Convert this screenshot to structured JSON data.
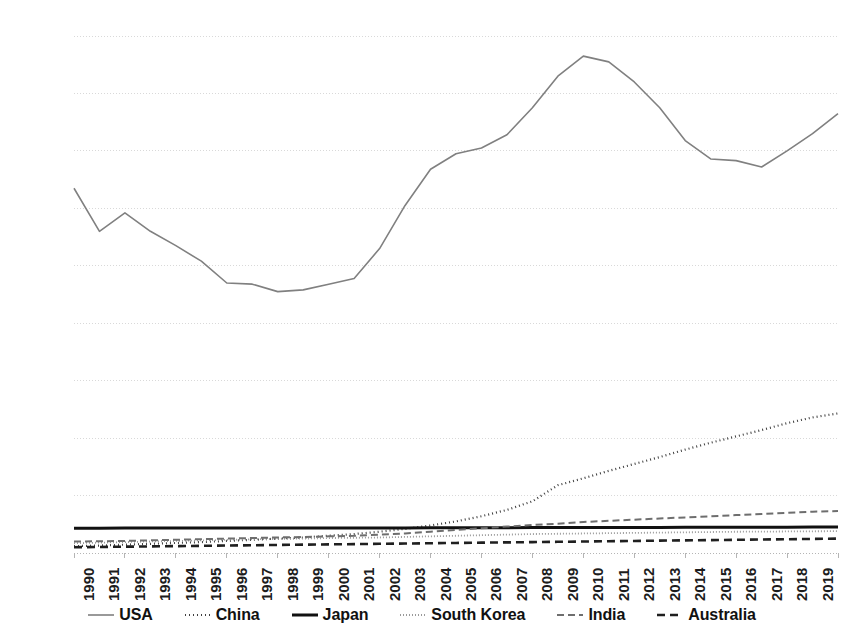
{
  "chart_data": {
    "type": "line",
    "title": "",
    "xlabel": "",
    "ylabel": "",
    "x": [
      1990,
      1991,
      1992,
      1993,
      1994,
      1995,
      1996,
      1997,
      1998,
      1999,
      2000,
      2001,
      2002,
      2003,
      2004,
      2005,
      2006,
      2007,
      2008,
      2009,
      2010,
      2011,
      2012,
      2013,
      2014,
      2015,
      2016,
      2017,
      2018,
      2019,
      2020
    ],
    "xlim": [
      1990,
      2020
    ],
    "ylim": [
      0,
      900000
    ],
    "ytick_labels": [
      "0",
      "100,000",
      "200,000",
      "300,000",
      "400,000",
      "500,000",
      "600,000",
      "700,000",
      "800,000",
      "900,000"
    ],
    "ytick_values": [
      0,
      100000,
      200000,
      300000,
      400000,
      500000,
      600000,
      700000,
      800000,
      900000
    ],
    "xtick_labels": [
      "1990",
      "1991",
      "1992",
      "1993",
      "1994",
      "1995",
      "1996",
      "1997",
      "1998",
      "1999",
      "2000",
      "2001",
      "2002",
      "2003",
      "2004",
      "2005",
      "2006",
      "2007",
      "2008",
      "2009",
      "2010",
      "2011",
      "2012",
      "2013",
      "2014",
      "2015",
      "2016",
      "2017",
      "2018",
      "2019",
      "2020"
    ],
    "grid": true,
    "legend_position": "bottom",
    "series": [
      {
        "name": "USA",
        "color": "#808080",
        "style": "solid",
        "width": 1.6,
        "dash": "",
        "values": [
          635000,
          560000,
          592000,
          560000,
          535000,
          508000,
          470000,
          468000,
          455000,
          458000,
          468000,
          478000,
          530000,
          605000,
          668000,
          695000,
          705000,
          728000,
          775000,
          830000,
          865000,
          855000,
          820000,
          775000,
          718000,
          686000,
          683000,
          672000,
          700000,
          730000,
          765000
        ]
      },
      {
        "name": "China",
        "color": "#3f3f3f",
        "style": "dotted",
        "width": 2.2,
        "dash": "1,3",
        "values": [
          12000,
          13000,
          14500,
          16000,
          17500,
          19000,
          21000,
          23000,
          25000,
          27000,
          30000,
          33000,
          37000,
          42000,
          48000,
          55000,
          64000,
          75000,
          90000,
          118000,
          130000,
          143000,
          155000,
          167000,
          180000,
          192000,
          203000,
          214000,
          226000,
          236000,
          243000
        ]
      },
      {
        "name": "Japan",
        "color": "#111111",
        "style": "solid",
        "width": 3.0,
        "dash": "",
        "values": [
          43000,
          43000,
          43500,
          43500,
          43500,
          43500,
          43500,
          43500,
          43500,
          43500,
          43500,
          43500,
          43500,
          43500,
          43800,
          44000,
          44000,
          44000,
          44200,
          44200,
          44500,
          44500,
          44500,
          44500,
          44800,
          44800,
          45000,
          45000,
          45000,
          45200,
          45200
        ]
      },
      {
        "name": "South Korea",
        "color": "#9a9a9a",
        "style": "fine-dotted",
        "width": 1.8,
        "dash": "1,2",
        "values": [
          17000,
          18000,
          19000,
          20000,
          21000,
          22000,
          23000,
          24000,
          24500,
          25000,
          26000,
          26500,
          27000,
          28000,
          29000,
          30000,
          31000,
          32000,
          33000,
          33500,
          34000,
          34500,
          35000,
          35500,
          36000,
          36500,
          37000,
          37200,
          37500,
          37800,
          38000
        ]
      },
      {
        "name": "India",
        "color": "#6e6e6e",
        "style": "dashed",
        "width": 2.0,
        "dash": "7,4",
        "values": [
          20000,
          20500,
          21000,
          22000,
          23000,
          24000,
          25000,
          26000,
          27000,
          28000,
          29000,
          30000,
          32000,
          34000,
          37000,
          40000,
          43000,
          46000,
          49000,
          51000,
          54000,
          56000,
          58000,
          60000,
          62000,
          64000,
          66000,
          68000,
          70000,
          72000,
          73000
        ]
      },
      {
        "name": "Australia",
        "color": "#1f1f1f",
        "style": "dashed",
        "width": 2.6,
        "dash": "8,5",
        "values": [
          10000,
          10500,
          11000,
          11500,
          12000,
          12500,
          13000,
          13500,
          14000,
          14500,
          15000,
          15500,
          16000,
          16500,
          17000,
          17500,
          18000,
          18500,
          19000,
          19500,
          20000,
          20500,
          21000,
          21500,
          22000,
          22500,
          23000,
          23500,
          24000,
          24500,
          25000
        ]
      }
    ]
  },
  "legend": {
    "items": [
      {
        "label": "USA"
      },
      {
        "label": "China"
      },
      {
        "label": "Japan"
      },
      {
        "label": "South Korea"
      },
      {
        "label": "India"
      },
      {
        "label": "Australia"
      }
    ]
  },
  "axis_colors": {
    "grid": "#d9d9d9",
    "axis": "#b5b5b5",
    "text": "#1c1c1c"
  }
}
